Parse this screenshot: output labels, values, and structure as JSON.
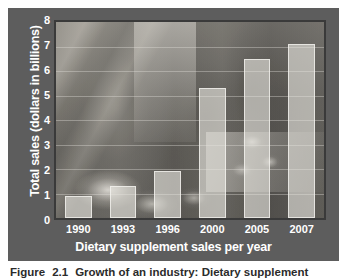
{
  "figure": {
    "caption_label": "Figure",
    "caption_number": "2.1",
    "caption_text": "Growth of an industry: Dietary supplement"
  },
  "chart_data": {
    "type": "bar",
    "title": "",
    "xlabel": "Dietary supplement sales per year",
    "ylabel": "Total sales (dollars in billions)",
    "categories": [
      "1990",
      "1993",
      "1996",
      "2000",
      "2005",
      "2007"
    ],
    "values": [
      0.9,
      1.3,
      1.9,
      5.3,
      6.5,
      7.1
    ],
    "ylim": [
      0,
      8
    ],
    "yticks": [
      "0",
      "1",
      "2",
      "3",
      "4",
      "5",
      "6",
      "7",
      "8"
    ],
    "grid": true,
    "legend": "none",
    "bar_color": "#e9e7e1",
    "background_color": "#5d5d5d",
    "text_color": "#ffffff"
  }
}
